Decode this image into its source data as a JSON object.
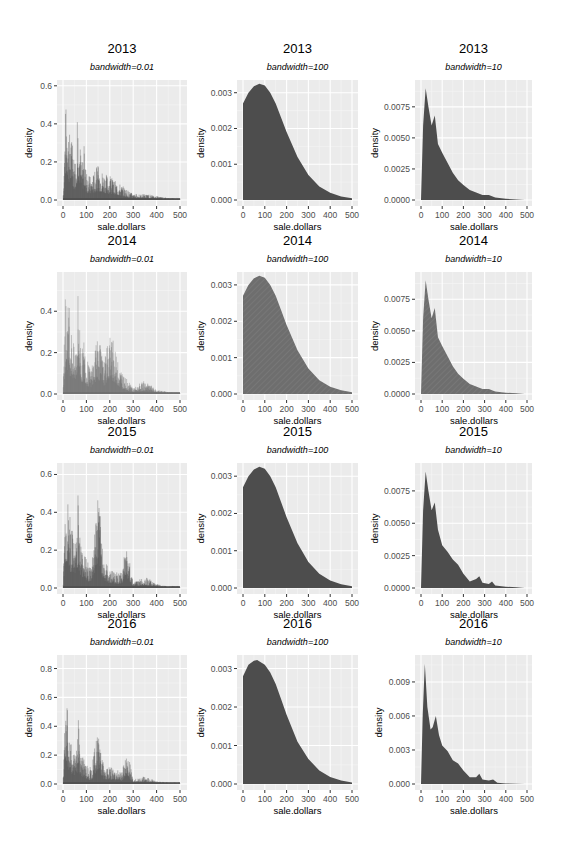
{
  "figure": {
    "background": "#ffffff",
    "panel_background": "#ebebeb",
    "grid_major_color": "#ffffff",
    "grid_minor_color": "#f5f5f5",
    "fill_dark": "#4d4d4d",
    "fill_light": "#6e6e6e",
    "axis_text_color": "#4d4d4d"
  },
  "chart_data": [
    {
      "type": "area",
      "title": "2013",
      "subtitle": "bandwidth=0.01",
      "xlabel": "sale.dollars",
      "ylabel": "density",
      "xlim": [
        0,
        500
      ],
      "ylim": [
        0,
        0.62
      ],
      "xticks": [
        "0",
        "100",
        "200",
        "300",
        "400",
        "500"
      ],
      "yticks": [
        "0.0",
        "0.2",
        "0.4",
        "0.6"
      ],
      "ytick_values": [
        0,
        0.2,
        0.4,
        0.6
      ],
      "grid": true,
      "kind": "spiky",
      "x": [
        0,
        10,
        15,
        20,
        25,
        30,
        40,
        50,
        60,
        65,
        70,
        80,
        90,
        100,
        120,
        150,
        175,
        200,
        250,
        300,
        350,
        400,
        450,
        500
      ],
      "values": [
        0,
        0.48,
        0.52,
        0.5,
        0.38,
        0.35,
        0.3,
        0.2,
        0.35,
        0.5,
        0.36,
        0.2,
        0.26,
        0.15,
        0.12,
        0.18,
        0.15,
        0.12,
        0.08,
        0.03,
        0.03,
        0.02,
        0.01,
        0.01
      ],
      "fill": "dark"
    },
    {
      "type": "area",
      "title": "2013",
      "subtitle": "bandwidth=100",
      "xlabel": "sale.dollars",
      "ylabel": "density",
      "xlim": [
        0,
        500
      ],
      "ylim": [
        0,
        0.0033
      ],
      "xticks": [
        "0",
        "100",
        "200",
        "300",
        "400",
        "500"
      ],
      "yticks": [
        "0.000",
        "0.001",
        "0.002",
        "0.003"
      ],
      "ytick_values": [
        0,
        0.001,
        0.002,
        0.003
      ],
      "grid": true,
      "kind": "smooth",
      "x": [
        0,
        25,
        50,
        75,
        100,
        125,
        150,
        175,
        200,
        250,
        300,
        350,
        400,
        450,
        500
      ],
      "values": [
        0.0027,
        0.003,
        0.00318,
        0.00325,
        0.0032,
        0.003,
        0.0027,
        0.0023,
        0.0019,
        0.0012,
        0.0007,
        0.00038,
        0.0002,
        0.0001,
        5e-05
      ],
      "fill": "dark"
    },
    {
      "type": "area",
      "title": "2013",
      "subtitle": "bandwidth=10",
      "xlabel": "sale.dollars",
      "ylabel": "density",
      "xlim": [
        0,
        500
      ],
      "ylim": [
        0,
        0.0095
      ],
      "xticks": [
        "0",
        "100",
        "200",
        "300",
        "400",
        "500"
      ],
      "yticks": [
        "0.0000",
        "0.0025",
        "0.0050",
        "0.0075"
      ],
      "ytick_values": [
        0,
        0.0025,
        0.005,
        0.0075
      ],
      "grid": true,
      "kind": "smooth",
      "x": [
        0,
        10,
        22,
        35,
        50,
        65,
        80,
        100,
        125,
        150,
        175,
        200,
        230,
        260,
        290,
        320,
        350,
        400,
        450,
        490
      ],
      "values": [
        0,
        0.006,
        0.009,
        0.0075,
        0.006,
        0.0068,
        0.0045,
        0.0038,
        0.003,
        0.0022,
        0.0016,
        0.0012,
        0.0008,
        0.0006,
        0.0004,
        0.0004,
        0.0002,
        0.0001,
        5e-05,
        0
      ],
      "fill": "dark"
    },
    {
      "type": "area",
      "title": "2014",
      "subtitle": "bandwidth=0.01",
      "xlabel": "sale.dollars",
      "ylabel": "density",
      "xlim": [
        0,
        500
      ],
      "ylim": [
        0,
        0.58
      ],
      "xticks": [
        "0",
        "100",
        "200",
        "300",
        "400",
        "500"
      ],
      "yticks": [
        "0.0",
        "0.2",
        "0.4"
      ],
      "ytick_values": [
        0,
        0.2,
        0.4
      ],
      "grid": true,
      "kind": "spiky",
      "x": [
        0,
        10,
        15,
        20,
        25,
        30,
        40,
        50,
        60,
        65,
        70,
        80,
        90,
        100,
        120,
        150,
        175,
        200,
        250,
        300,
        350,
        400,
        450,
        500
      ],
      "values": [
        0,
        0.45,
        0.47,
        0.46,
        0.4,
        0.35,
        0.3,
        0.2,
        0.36,
        0.55,
        0.38,
        0.2,
        0.28,
        0.16,
        0.12,
        0.28,
        0.15,
        0.3,
        0.1,
        0.03,
        0.06,
        0.02,
        0.01,
        0.01
      ],
      "fill": "light"
    },
    {
      "type": "area",
      "title": "2014",
      "subtitle": "bandwidth=100",
      "xlabel": "sale.dollars",
      "ylabel": "density",
      "xlim": [
        0,
        500
      ],
      "ylim": [
        0,
        0.0033
      ],
      "xticks": [
        "0",
        "100",
        "200",
        "300",
        "400",
        "500"
      ],
      "yticks": [
        "0.000",
        "0.001",
        "0.002",
        "0.003"
      ],
      "ytick_values": [
        0,
        0.001,
        0.002,
        0.003
      ],
      "grid": true,
      "kind": "smooth",
      "x": [
        0,
        25,
        50,
        75,
        100,
        125,
        150,
        175,
        200,
        250,
        300,
        350,
        400,
        450,
        500
      ],
      "values": [
        0.0027,
        0.003,
        0.00318,
        0.00325,
        0.0032,
        0.003,
        0.0027,
        0.0023,
        0.0019,
        0.0012,
        0.0007,
        0.00038,
        0.0002,
        0.0001,
        5e-05
      ],
      "fill": "light"
    },
    {
      "type": "area",
      "title": "2014",
      "subtitle": "bandwidth=10",
      "xlabel": "sale.dollars",
      "ylabel": "density",
      "xlim": [
        0,
        500
      ],
      "ylim": [
        0,
        0.0095
      ],
      "xticks": [
        "0",
        "100",
        "200",
        "300",
        "400",
        "500"
      ],
      "yticks": [
        "0.0000",
        "0.0025",
        "0.0050",
        "0.0075"
      ],
      "ytick_values": [
        0,
        0.0025,
        0.005,
        0.0075
      ],
      "grid": true,
      "kind": "smooth",
      "x": [
        0,
        10,
        22,
        35,
        50,
        65,
        80,
        100,
        125,
        150,
        175,
        200,
        230,
        260,
        290,
        320,
        350,
        400,
        450,
        490
      ],
      "values": [
        0,
        0.006,
        0.009,
        0.0075,
        0.006,
        0.0068,
        0.0045,
        0.0038,
        0.003,
        0.0022,
        0.0016,
        0.0012,
        0.0008,
        0.0006,
        0.0004,
        0.0004,
        0.0002,
        0.0001,
        5e-05,
        0
      ],
      "fill": "light"
    },
    {
      "type": "area",
      "title": "2015",
      "subtitle": "bandwidth=0.01",
      "xlabel": "sale.dollars",
      "ylabel": "density",
      "xlim": [
        0,
        500
      ],
      "ylim": [
        0,
        0.65
      ],
      "xticks": [
        "0",
        "100",
        "200",
        "300",
        "400",
        "500"
      ],
      "yticks": [
        "0.0",
        "0.2",
        "0.4",
        "0.6"
      ],
      "ytick_values": [
        0,
        0.2,
        0.4,
        0.6
      ],
      "grid": true,
      "kind": "spiky",
      "x": [
        0,
        10,
        15,
        20,
        25,
        30,
        40,
        50,
        60,
        65,
        70,
        80,
        90,
        100,
        120,
        150,
        175,
        200,
        250,
        270,
        300,
        350,
        400,
        450,
        500
      ],
      "values": [
        0,
        0.52,
        0.5,
        0.48,
        0.42,
        0.35,
        0.3,
        0.2,
        0.4,
        0.47,
        0.35,
        0.2,
        0.25,
        0.15,
        0.12,
        0.53,
        0.15,
        0.1,
        0.08,
        0.22,
        0.03,
        0.06,
        0.02,
        0.01,
        0.01
      ],
      "fill": "dark"
    },
    {
      "type": "area",
      "title": "2015",
      "subtitle": "bandwidth=100",
      "xlabel": "sale.dollars",
      "ylabel": "density",
      "xlim": [
        0,
        500
      ],
      "ylim": [
        0,
        0.0033
      ],
      "xticks": [
        "0",
        "100",
        "200",
        "300",
        "400",
        "500"
      ],
      "yticks": [
        "0.000",
        "0.001",
        "0.002",
        "0.003"
      ],
      "ytick_values": [
        0,
        0.001,
        0.002,
        0.003
      ],
      "grid": true,
      "kind": "smooth",
      "x": [
        0,
        25,
        50,
        75,
        100,
        125,
        150,
        175,
        200,
        250,
        300,
        350,
        400,
        450,
        500
      ],
      "values": [
        0.0027,
        0.003,
        0.00318,
        0.00325,
        0.0032,
        0.003,
        0.0027,
        0.0023,
        0.0019,
        0.0012,
        0.0007,
        0.00038,
        0.0002,
        0.0001,
        5e-05
      ],
      "fill": "dark"
    },
    {
      "type": "area",
      "title": "2015",
      "subtitle": "bandwidth=10",
      "xlabel": "sale.dollars",
      "ylabel": "density",
      "xlim": [
        0,
        500
      ],
      "ylim": [
        0,
        0.0095
      ],
      "xticks": [
        "0",
        "100",
        "200",
        "300",
        "400",
        "500"
      ],
      "yticks": [
        "0.0000",
        "0.0025",
        "0.0050",
        "0.0075"
      ],
      "ytick_values": [
        0,
        0.0025,
        0.005,
        0.0075
      ],
      "grid": true,
      "kind": "smooth",
      "x": [
        0,
        10,
        22,
        35,
        50,
        65,
        80,
        100,
        125,
        150,
        175,
        200,
        230,
        260,
        275,
        290,
        320,
        335,
        350,
        400,
        450,
        490
      ],
      "values": [
        0,
        0.006,
        0.009,
        0.0075,
        0.006,
        0.0066,
        0.0045,
        0.0033,
        0.0028,
        0.0022,
        0.0018,
        0.0011,
        0.0005,
        0.0007,
        0.0009,
        0.0004,
        0.0003,
        0.0005,
        0.0002,
        0.0001,
        5e-05,
        0
      ],
      "fill": "dark"
    },
    {
      "type": "area",
      "title": "2016",
      "subtitle": "bandwidth=0.01",
      "xlabel": "sale.dollars",
      "ylabel": "density",
      "xlim": [
        0,
        500
      ],
      "ylim": [
        0,
        0.88
      ],
      "xticks": [
        "0",
        "100",
        "200",
        "300",
        "400",
        "500"
      ],
      "yticks": [
        "0.0",
        "0.2",
        "0.4",
        "0.6",
        "0.8"
      ],
      "ytick_values": [
        0,
        0.2,
        0.4,
        0.6,
        0.8
      ],
      "grid": true,
      "kind": "spiky",
      "x": [
        0,
        10,
        15,
        20,
        25,
        30,
        40,
        50,
        60,
        65,
        70,
        80,
        90,
        100,
        120,
        150,
        175,
        200,
        250,
        275,
        300,
        350,
        400,
        450,
        500
      ],
      "values": [
        0,
        0.75,
        0.6,
        0.5,
        0.38,
        0.3,
        0.25,
        0.2,
        0.3,
        0.48,
        0.3,
        0.18,
        0.2,
        0.14,
        0.1,
        0.4,
        0.12,
        0.12,
        0.08,
        0.22,
        0.03,
        0.05,
        0.02,
        0.01,
        0.01
      ],
      "fill": "dark"
    },
    {
      "type": "area",
      "title": "2016",
      "subtitle": "bandwidth=100",
      "xlabel": "sale.dollars",
      "ylabel": "density",
      "xlim": [
        0,
        500
      ],
      "ylim": [
        0,
        0.0033
      ],
      "xticks": [
        "0",
        "100",
        "200",
        "300",
        "400",
        "500"
      ],
      "yticks": [
        "0.000",
        "0.001",
        "0.002",
        "0.003"
      ],
      "ytick_values": [
        0,
        0.001,
        0.002,
        0.003
      ],
      "grid": true,
      "kind": "smooth",
      "x": [
        0,
        25,
        50,
        65,
        100,
        125,
        150,
        175,
        200,
        250,
        300,
        350,
        400,
        450,
        500
      ],
      "values": [
        0.0028,
        0.0031,
        0.0032,
        0.00322,
        0.0031,
        0.0029,
        0.0026,
        0.0022,
        0.0018,
        0.0011,
        0.00065,
        0.00035,
        0.00018,
        9e-05,
        4e-05
      ],
      "fill": "dark"
    },
    {
      "type": "area",
      "title": "2016",
      "subtitle": "bandwidth=10",
      "xlabel": "sale.dollars",
      "ylabel": "density",
      "xlim": [
        0,
        500
      ],
      "ylim": [
        0,
        0.0112
      ],
      "xticks": [
        "0",
        "100",
        "200",
        "300",
        "400",
        "500"
      ],
      "yticks": [
        "0.000",
        "0.003",
        "0.006",
        "0.009"
      ],
      "ytick_values": [
        0,
        0.003,
        0.006,
        0.009
      ],
      "grid": true,
      "kind": "smooth",
      "x": [
        0,
        8,
        18,
        30,
        45,
        55,
        70,
        85,
        100,
        125,
        150,
        175,
        200,
        230,
        260,
        275,
        290,
        320,
        340,
        360,
        400,
        450,
        490
      ],
      "values": [
        0,
        0.006,
        0.0106,
        0.0068,
        0.0048,
        0.005,
        0.006,
        0.0043,
        0.0034,
        0.0029,
        0.0021,
        0.0018,
        0.0012,
        0.0006,
        0.0006,
        0.0009,
        0.0004,
        0.0003,
        0.0004,
        0.0001,
        5e-05,
        3e-05,
        0
      ],
      "fill": "dark"
    }
  ]
}
